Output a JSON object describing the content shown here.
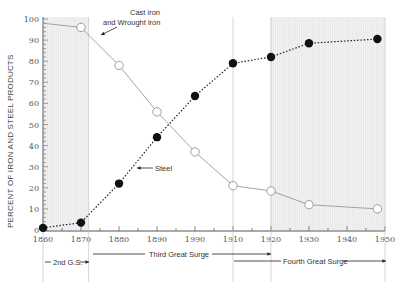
{
  "chart_data": {
    "type": "line",
    "title": "",
    "xlabel": "",
    "ylabel": "PERCENT OF IRON AND STEEL PRODUCTS",
    "xlim": [
      1860,
      1950
    ],
    "ylim": [
      0,
      100
    ],
    "x_tick_labels": [
      "1860",
      "1870",
      "1880",
      "1890",
      "1990",
      "1910",
      "1920",
      "1930",
      "1940",
      "1950"
    ],
    "y_tick_labels": [
      "0",
      "10",
      "20",
      "30",
      "40",
      "50",
      "60",
      "70",
      "80",
      "90",
      "100"
    ],
    "grid": false,
    "series": [
      {
        "name": "Cast iron and Wrought iron",
        "style": "solid-gray-open-circles",
        "x": [
          1860,
          1870,
          1880,
          1890,
          1900,
          1910,
          1920,
          1930,
          1948
        ],
        "y": [
          98,
          96,
          78,
          56,
          37,
          21,
          18.5,
          12,
          10
        ]
      },
      {
        "name": "Steel",
        "style": "dotted-black-filled-circles",
        "x": [
          1860,
          1870,
          1880,
          1890,
          1900,
          1910,
          1920,
          1930,
          1948
        ],
        "y": [
          1,
          3.5,
          22,
          44,
          63.5,
          79,
          82,
          88.5,
          90.5
        ]
      }
    ],
    "shaded_regions": [
      {
        "from": 1860,
        "to": 1872
      },
      {
        "from": 1920,
        "to": 1950
      }
    ],
    "annotations": {
      "cast_iron_label_line1": "Cast iron",
      "cast_iron_label_line2": "and Wrought iron",
      "steel_label": "Steel",
      "surge_2": "2nd G.S.",
      "surge_3": "Third Great Surge",
      "surge_4": "Fourth Great Surge"
    }
  }
}
